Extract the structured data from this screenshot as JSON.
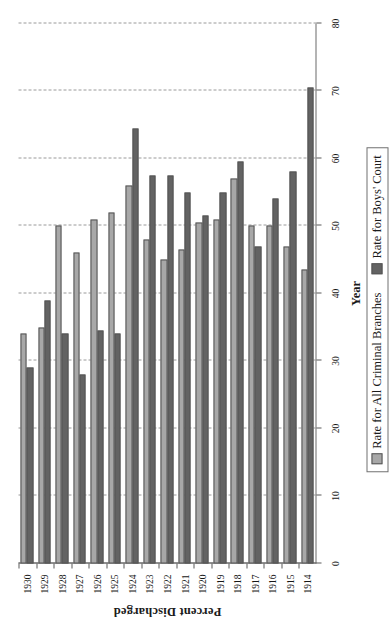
{
  "chart_data": {
    "type": "bar",
    "orientation": "horizontal",
    "title": "",
    "xlabel": "Percent Discharged",
    "ylabel": "Year",
    "xlim": [
      0,
      80
    ],
    "xticks": [
      0,
      10,
      20,
      30,
      40,
      50,
      60,
      70,
      80
    ],
    "grid": true,
    "legend_position": "bottom",
    "categories": [
      "1914",
      "1915",
      "1916",
      "1917",
      "1918",
      "1919",
      "1920",
      "1921",
      "1922",
      "1923",
      "1924",
      "1925",
      "1926",
      "1927",
      "1928",
      "1929",
      "1930"
    ],
    "series": [
      {
        "name": "Rate for All Criminal Branches",
        "color": "#a8a8a8",
        "values": [
          43.5,
          47,
          50,
          50,
          57,
          51,
          50.5,
          46.5,
          45,
          48,
          56,
          52,
          51,
          46,
          50,
          35,
          34
        ]
      },
      {
        "name": "Rate for Boys' Court",
        "color": "#636363",
        "values": [
          70.5,
          58,
          54,
          47,
          59.5,
          55,
          51.5,
          55,
          57.5,
          57.5,
          64.5,
          34,
          34.5,
          28,
          34,
          39,
          29
        ]
      }
    ]
  },
  "axis": {
    "x_title": "Percent Discharged",
    "y_title": "Year",
    "tick_labels": [
      "0",
      "10",
      "20",
      "30",
      "40",
      "50",
      "60",
      "70",
      "80"
    ],
    "category_labels": [
      "1914",
      "1915",
      "1916",
      "1917",
      "1918",
      "1919",
      "1920",
      "1921",
      "1922",
      "1923",
      "1924",
      "1925",
      "1926",
      "1927",
      "1928",
      "1929",
      "1930"
    ]
  },
  "legend": {
    "items": [
      {
        "label": "Rate for All Criminal Branches",
        "color": "#a8a8a8",
        "swatch": "legend-swatch-light"
      },
      {
        "label": "Rate for Boys' Court",
        "color": "#636363",
        "swatch": "legend-swatch-dark"
      }
    ]
  }
}
